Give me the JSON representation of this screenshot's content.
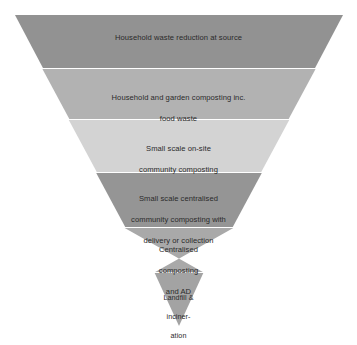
{
  "diagram": {
    "type": "inverted-pyramid",
    "title": "",
    "background_color": "#ffffff",
    "text_color": "#2a2a2a",
    "divider_color": "#ffffff",
    "geometry": {
      "top_left_x": 15,
      "top_right_x": 343,
      "top_y": 15,
      "apex_x": 179,
      "apex_y": 326,
      "band_boundaries_y": [
        15,
        68,
        119,
        172,
        227,
        272,
        326
      ]
    },
    "bands": [
      {
        "index": 1,
        "label": "Household waste reduction at source",
        "lines": [
          "Household waste reduction at source"
        ],
        "color": "#929292"
      },
      {
        "index": 2,
        "label": "Household and garden composting inc. food waste",
        "lines": [
          "Household and garden composting inc.",
          "food waste"
        ],
        "color": "#b2b2b2"
      },
      {
        "index": 3,
        "label": "Small scale on-site community composting",
        "lines": [
          "Small scale on-site",
          "community composting"
        ],
        "color": "#d3d3d3"
      },
      {
        "index": 4,
        "label": "Small scale centralised community composting with delivery or collection",
        "lines": [
          "Small scale centralised",
          "community composting with",
          "delivery or collection"
        ],
        "color": "#959595"
      },
      {
        "index": 5,
        "label": "Centralised composting and AD",
        "lines": [
          "Centralised",
          "composting",
          "and AD"
        ],
        "color": "#a9a9a9"
      },
      {
        "index": 6,
        "label": "Landfill & incineration",
        "lines": [
          "Landfill &",
          "inciner-",
          "ation"
        ],
        "color": "#a3a3a3"
      }
    ]
  }
}
